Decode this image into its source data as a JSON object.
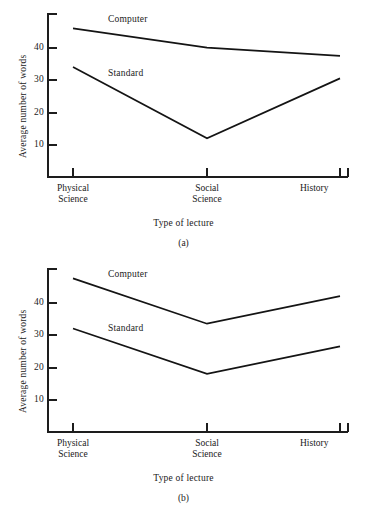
{
  "chart_data": [
    {
      "type": "line",
      "panel": "(a)",
      "title": "",
      "xlabel": "Type of lecture",
      "ylabel": "Average number of words",
      "categories": [
        "Physical\nScience",
        "Social\nScience",
        "History"
      ],
      "category_plain": [
        "Physical Science",
        "Social Science",
        "History"
      ],
      "yticks": [
        10,
        20,
        30,
        40
      ],
      "ylim": [
        0,
        48
      ],
      "grid": false,
      "legend_position": "inline-labels",
      "series": [
        {
          "name": "Computer",
          "values": [
            46,
            40,
            37.5
          ]
        },
        {
          "name": "Standard",
          "values": [
            34,
            12,
            30.5
          ]
        }
      ]
    },
    {
      "type": "line",
      "panel": "(b)",
      "title": "",
      "xlabel": "Type of lecture",
      "ylabel": "Average number of words",
      "categories": [
        "Physical\nScience",
        "Social\nScience",
        "History"
      ],
      "category_plain": [
        "Physical Science",
        "Social Science",
        "History"
      ],
      "yticks": [
        10,
        20,
        30,
        40
      ],
      "ylim": [
        0,
        48
      ],
      "grid": false,
      "legend_position": "inline-labels",
      "series": [
        {
          "name": "Computer",
          "values": [
            47.5,
            33.5,
            42
          ]
        },
        {
          "name": "Standard",
          "values": [
            32,
            18,
            26.5
          ]
        }
      ]
    }
  ],
  "panel_a": {
    "caption": "(a)",
    "xlabel": "Type of lecture",
    "ylabel": "Average number of words",
    "ytick_labels": [
      "40",
      "30",
      "20",
      "10"
    ],
    "cat_labels": [
      "Physical\nScience",
      "Social\nScience",
      "History"
    ],
    "series_labels": [
      "Computer",
      "Standard"
    ]
  },
  "panel_b": {
    "caption": "(b)",
    "xlabel": "Type of lecture",
    "ylabel": "Average number of words",
    "ytick_labels": [
      "40",
      "30",
      "20",
      "10"
    ],
    "cat_labels": [
      "Physical\nScience",
      "Social\nScience",
      "History"
    ],
    "series_labels": [
      "Computer",
      "Standard"
    ]
  },
  "style": {
    "line_color": "#141414",
    "axis_color": "#1d1d1d",
    "background": "#ffffff"
  }
}
